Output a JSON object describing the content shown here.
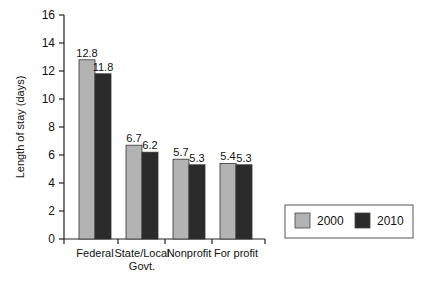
{
  "chart_data": {
    "type": "bar",
    "title": "",
    "xlabel": "",
    "ylabel": "Length of stay (days)",
    "ylim": [
      0,
      16
    ],
    "yticks": [
      0,
      2,
      4,
      6,
      8,
      10,
      12,
      14,
      16
    ],
    "grid": false,
    "legend_position": "right",
    "categories": [
      "Federal",
      "State/Local Govt.",
      "Nonprofit",
      "For profit"
    ],
    "category_lines": [
      [
        "Federal"
      ],
      [
        "State/Local",
        "Govt."
      ],
      [
        "Nonprofit"
      ],
      [
        "For profit"
      ]
    ],
    "series": [
      {
        "name": "2000",
        "color": "#b3b3b3",
        "values": [
          12.8,
          6.7,
          5.7,
          5.4
        ],
        "labels": [
          "12.8",
          "6.7",
          "5.7",
          "5.4"
        ]
      },
      {
        "name": "2010",
        "color": "#2b2b2b",
        "values": [
          11.8,
          6.2,
          5.3,
          5.3
        ],
        "labels": [
          "11.8",
          "6.2",
          "5.3",
          "5.3"
        ]
      }
    ]
  }
}
